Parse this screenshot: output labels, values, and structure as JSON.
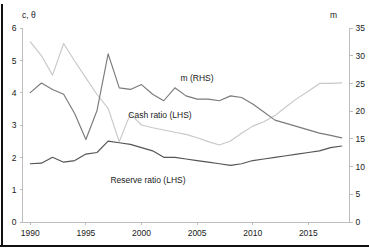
{
  "chart_data": {
    "type": "line",
    "title": "",
    "xlabel": "",
    "ylabel": "c, θ",
    "y2label": "m",
    "grid": false,
    "legend_position": "inline-annotations",
    "xlim": [
      1989.3,
      2018.7
    ],
    "ylim": [
      0,
      6
    ],
    "y2lim": [
      0,
      35
    ],
    "xticks": [
      1990,
      1995,
      2000,
      2005,
      2010,
      2015
    ],
    "xtick_labels": [
      "1990",
      "1995",
      "2000",
      "2005",
      "2010",
      "2015"
    ],
    "yticks": [
      0,
      1,
      2,
      3,
      4,
      5,
      6
    ],
    "ytick_labels": [
      "0",
      "1",
      "2",
      "3",
      "4",
      "5",
      "6"
    ],
    "y2ticks": [
      0,
      5,
      10,
      15,
      20,
      25,
      30,
      35
    ],
    "y2tick_labels": [
      "0",
      "5",
      "10",
      "15",
      "20",
      "25",
      "30",
      "35"
    ],
    "x": [
      1990,
      1991,
      1992,
      1993,
      1994,
      1995,
      1996,
      1997,
      1998,
      1999,
      2000,
      2001,
      2002,
      2003,
      2004,
      2005,
      2006,
      2007,
      2008,
      2009,
      2010,
      2011,
      2012,
      2013,
      2014,
      2015,
      2016,
      2017,
      2018
    ],
    "series": [
      {
        "name": "m (RHS)",
        "axis": "right",
        "color": "#c8c8c8",
        "label": "m (RHS)",
        "values": [
          32.5,
          30.0,
          26.5,
          32.2,
          29.0,
          26.0,
          23.0,
          20.5,
          14.5,
          19.5,
          17.5,
          17.0,
          16.6,
          16.2,
          15.8,
          15.2,
          14.5,
          13.9,
          14.6,
          16.0,
          17.3,
          18.1,
          19.2,
          20.8,
          22.3,
          23.6,
          25.0,
          25.0,
          25.1
        ]
      },
      {
        "name": "Cash ratio (LHS)",
        "axis": "left",
        "color": "#7a7a7a",
        "label": "Cash ratio (LHS)",
        "values": [
          4.0,
          4.3,
          4.1,
          3.95,
          3.35,
          2.55,
          3.45,
          5.2,
          4.15,
          4.1,
          4.25,
          3.95,
          3.75,
          4.15,
          3.9,
          3.8,
          3.8,
          3.75,
          3.9,
          3.85,
          3.65,
          3.4,
          3.15,
          3.05,
          2.95,
          2.85,
          2.75,
          2.68,
          2.6
        ]
      },
      {
        "name": "Reserve ratio (LHS)",
        "axis": "left",
        "color": "#555555",
        "label": "Reserve ratio (LHS)",
        "values": [
          1.8,
          1.82,
          2.0,
          1.85,
          1.9,
          2.1,
          2.15,
          2.5,
          2.45,
          2.4,
          2.3,
          2.2,
          2.0,
          2.0,
          1.95,
          1.9,
          1.85,
          1.8,
          1.75,
          1.8,
          1.9,
          1.95,
          2.0,
          2.05,
          2.1,
          2.15,
          2.2,
          2.3,
          2.35
        ]
      }
    ],
    "annotations": [
      {
        "text": "m (RHS)",
        "x_px": 197,
        "y_px": 81
      },
      {
        "text": "Cash ratio (LHS)",
        "x_px": 160,
        "y_px": 118
      },
      {
        "text": "Reserve ratio (LHS)",
        "x_px": 148,
        "y_px": 183
      }
    ]
  },
  "axes": {
    "left_title": "c, θ",
    "right_title": "m"
  }
}
